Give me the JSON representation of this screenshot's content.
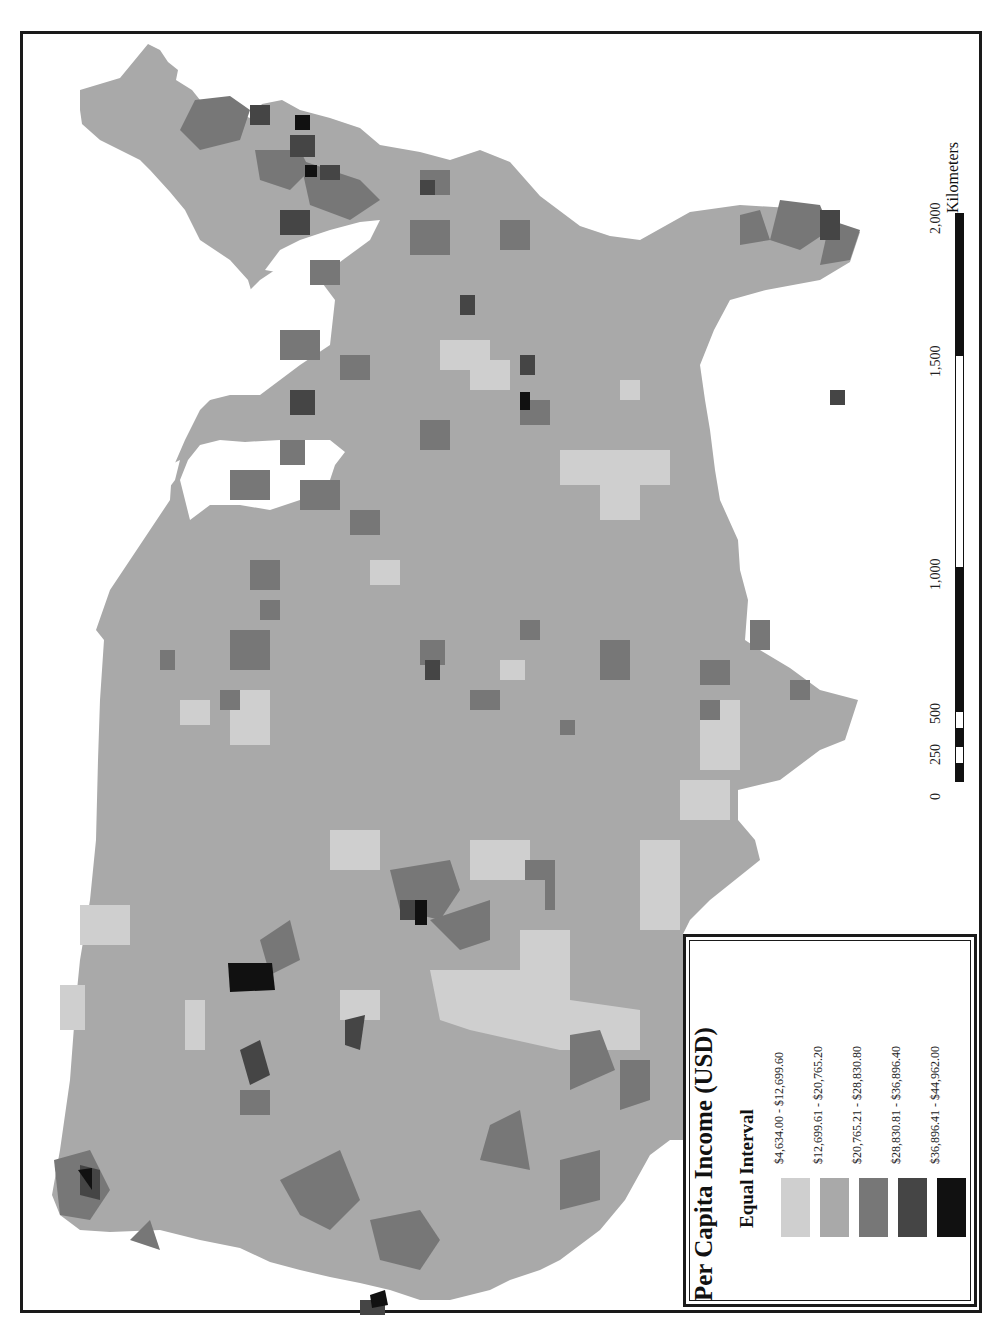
{
  "map": {
    "title": "Per Capita Income (USD)",
    "orientation": "rotated 90° counter-clockwise (north to the left)",
    "background_color": "#ffffff",
    "frame_color": "#1a1a1a"
  },
  "legend": {
    "title": "Per Capita Income (USD)",
    "classification": "Equal Interval",
    "classes": [
      {
        "label": "$4,634.00 - $12,699.60",
        "color": "#cfcfcf"
      },
      {
        "label": "$12,699.61 - $20,765.20",
        "color": "#a9a9a9"
      },
      {
        "label": "$20,765.21 - $28,830.80",
        "color": "#777777"
      },
      {
        "label": "$28,830.81 - $36,896.40",
        "color": "#454545"
      },
      {
        "label": "$36,896.41 - $44,962.00",
        "color": "#111111"
      }
    ]
  },
  "scale_bar": {
    "unit": "Kilometers",
    "ticks": [
      "0",
      "250",
      "500",
      "1,000",
      "1,500",
      "2,000"
    ],
    "segments": [
      {
        "from": 0,
        "to": 125,
        "fill": "black"
      },
      {
        "from": 125,
        "to": 250,
        "fill": "white"
      },
      {
        "from": 250,
        "to": 375,
        "fill": "black"
      },
      {
        "from": 375,
        "to": 500,
        "fill": "white"
      },
      {
        "from": 500,
        "to": 1000,
        "fill": "black"
      },
      {
        "from": 1000,
        "to": 1500,
        "fill": "white"
      },
      {
        "from": 1500,
        "to": 2000,
        "fill": "black"
      }
    ]
  }
}
